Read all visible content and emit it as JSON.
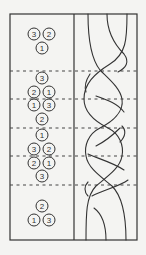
{
  "figure": {
    "frame": {
      "x": 10,
      "y": 14,
      "w": 127,
      "h": 226
    },
    "divider_x": 74,
    "section_lines_y": [
      71,
      99,
      128,
      156,
      185
    ]
  },
  "states": [
    {
      "circles": [
        {
          "label": "3",
          "x": 34,
          "y": 34
        },
        {
          "label": "2",
          "x": 49,
          "y": 34
        },
        {
          "label": "1",
          "x": 42,
          "y": 48
        }
      ]
    },
    {
      "circles": [
        {
          "label": "3",
          "x": 42,
          "y": 78
        }
      ]
    },
    {
      "circles": [
        {
          "label": "2",
          "x": 34,
          "y": 92
        },
        {
          "label": "1",
          "x": 49,
          "y": 92
        }
      ]
    },
    {
      "circles": [
        {
          "label": "1",
          "x": 34,
          "y": 105
        },
        {
          "label": "3",
          "x": 49,
          "y": 105
        }
      ]
    },
    {
      "circles": [
        {
          "label": "2",
          "x": 42,
          "y": 119
        }
      ]
    },
    {
      "circles": [
        {
          "label": "1",
          "x": 42,
          "y": 135
        }
      ]
    },
    {
      "circles": [
        {
          "label": "3",
          "x": 34,
          "y": 149
        },
        {
          "label": "2",
          "x": 49,
          "y": 149
        }
      ]
    },
    {
      "circles": [
        {
          "label": "2",
          "x": 34,
          "y": 163
        },
        {
          "label": "1",
          "x": 49,
          "y": 163
        }
      ]
    },
    {
      "circles": [
        {
          "label": "3",
          "x": 42,
          "y": 176
        }
      ]
    },
    {
      "circles": [
        {
          "label": "2",
          "x": 42,
          "y": 206
        },
        {
          "label": "1",
          "x": 34,
          "y": 220
        },
        {
          "label": "3",
          "x": 49,
          "y": 220
        }
      ]
    }
  ],
  "braid": {
    "strands": [
      "M88,14 C88,40 92,60 100,70 C110,80 120,88 122,99 C124,112 112,122 100,128 C88,134 84,146 86,156 C88,168 100,176 112,186 C122,196 126,214 126,240",
      "M107,14 C107,32 114,44 124,54 C130,62 126,68 118,72",
      "M127,14 C127,40 126,54 110,64 C94,74 84,84 84,99 C84,112 96,122 108,128 C120,134 124,146 122,156 C120,168 108,176 96,186 C86,196 86,214 86,240",
      "M90,74 C86,80 84,86 86,92",
      "M96,96 C108,100 118,104 124,112",
      "M122,126 C126,130 126,136 120,142",
      "M96,146 C108,140 116,132 120,128",
      "M88,154 C96,158 112,162 124,170",
      "M88,182 C84,186 84,192 88,196",
      "M92,196 C104,190 120,186 128,180",
      "M94,208 C102,214 106,226 106,240"
    ]
  }
}
